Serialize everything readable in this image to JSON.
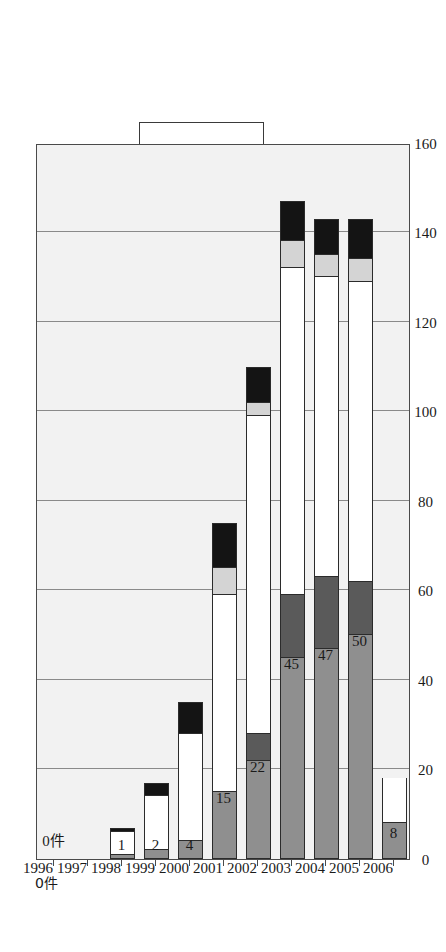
{
  "chart_data": {
    "type": "bar",
    "subtype": "stacked-bar",
    "title": "",
    "xlabel": "",
    "ylabel": "",
    "unit_label": "0件",
    "categories": [
      "1996",
      "1997",
      "1998",
      "1999",
      "2000",
      "2001",
      "2002",
      "2003",
      "2004",
      "2005",
      "2006"
    ],
    "ylim": [
      0,
      160
    ],
    "yticks": [
      "0",
      "20",
      "40",
      "60",
      "80",
      "100",
      "120",
      "140",
      "160"
    ],
    "ytick_values": [
      0,
      20,
      40,
      60,
      80,
      100,
      120,
      140,
      160
    ],
    "grid": true,
    "grid_axis": "y",
    "legend_position": "top-right",
    "series": [
      {
        "name": "医療機関",
        "color": "#8f8f8f",
        "values": [
          0,
          0,
          1,
          2,
          4,
          15,
          22,
          45,
          47,
          50,
          8
        ]
      },
      {
        "name": "歯科",
        "color": "#5a5a5a",
        "values": [
          0,
          0,
          0,
          0,
          0,
          0,
          6,
          14,
          16,
          12,
          0
        ]
      },
      {
        "name": "保健・福祉",
        "color": "#ffffff",
        "values": [
          0,
          0,
          5,
          12,
          24,
          44,
          71,
          73,
          67,
          67,
          10
        ]
      },
      {
        "name": "保育園・乳児院",
        "color": "#d4d4d4",
        "values": [
          0,
          0,
          0,
          0,
          0,
          6,
          3,
          6,
          5,
          5,
          0
        ]
      },
      {
        "name": "その他",
        "color": "#141414",
        "values": [
          0,
          0,
          1,
          3,
          7,
          10,
          8,
          9,
          8,
          9,
          0
        ]
      }
    ],
    "bar_value_labels": [
      "0件",
      "",
      "1",
      "2",
      "4",
      "15",
      "22",
      "45",
      "47",
      "50",
      "8"
    ]
  },
  "legend": {
    "items": [
      {
        "label": "その他",
        "swatch": "#141414"
      },
      {
        "label": "保育園・乳児院",
        "swatch": "#d4d4d4"
      },
      {
        "label": "保健・福祉",
        "swatch": "#ffffff"
      },
      {
        "label": "歯科",
        "swatch": "#5a5a5a"
      },
      {
        "label": "医療機関",
        "swatch": "#8f8f8f"
      }
    ]
  }
}
